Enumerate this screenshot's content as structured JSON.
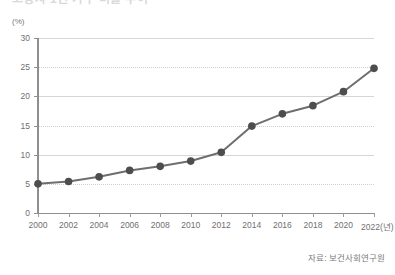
{
  "figure": {
    "title": "고령자 1인 가구 비율 추이",
    "y_unit_label": "(%)",
    "source_note": "자료: 보건사회연구원",
    "x_axis_unit_suffix": "(년)"
  },
  "style": {
    "line_color": "#6e6e6e",
    "marker_color": "#4d4d4d",
    "grid_color": "#d6d6d6",
    "axis_color": "#8f8f8f",
    "text_color": "#6f6f6f",
    "background": "#ffffff"
  },
  "chart_data": {
    "type": "line",
    "title": "고령자 1인 가구 비율 추이",
    "xlabel": "(년)",
    "ylabel": "(%)",
    "x": [
      2000,
      2002,
      2004,
      2006,
      2008,
      2010,
      2012,
      2014,
      2016,
      2018,
      2020,
      2022
    ],
    "categories": [
      "2000",
      "2002",
      "2004",
      "2006",
      "2008",
      "2010",
      "2012",
      "2014",
      "2016",
      "2018",
      "2020",
      "2022"
    ],
    "values": [
      5.0,
      5.4,
      6.2,
      7.3,
      8.0,
      8.9,
      10.4,
      14.9,
      17.0,
      18.4,
      20.8,
      24.8
    ],
    "series": [
      {
        "name": "비율",
        "values": [
          5.0,
          5.4,
          6.2,
          7.3,
          8.0,
          8.9,
          10.4,
          14.9,
          17.0,
          18.4,
          20.8,
          24.8
        ]
      }
    ],
    "ylim": [
      0,
      30
    ],
    "yticks": [
      0,
      5,
      10,
      15,
      20,
      25,
      30
    ],
    "ytick_labels": [
      "0",
      "5",
      "10",
      "15",
      "20",
      "25",
      "30"
    ],
    "xlim": [
      2000,
      2022
    ],
    "xtick_labels": [
      "2000",
      "2002",
      "2004",
      "2006",
      "2008",
      "2010",
      "2012",
      "2014",
      "2016",
      "2018",
      "2020",
      "2022(년)"
    ],
    "grid": true,
    "grid_axis": "y",
    "legend": false,
    "markers": "circle",
    "source": "자료: 보건사회연구원"
  }
}
